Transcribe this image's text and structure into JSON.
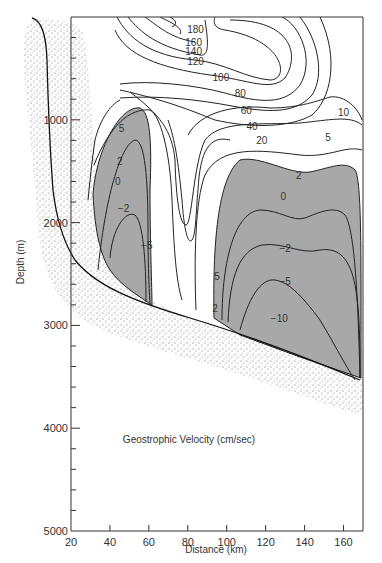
{
  "chart_data": {
    "type": "contour",
    "title": "Geostrophic Velocity (cm/sec)",
    "xlabel": "Distance (km)",
    "ylabel": "Depth (m)",
    "xlim": [
      20,
      170
    ],
    "ylim": [
      0,
      5000
    ],
    "y_inverted": true,
    "x_ticks": [
      20,
      40,
      60,
      80,
      100,
      120,
      140,
      160
    ],
    "y_ticks_labeled": [
      1000,
      2000,
      3000,
      4000,
      5000
    ],
    "y_minor_step": 200,
    "contour_levels": [
      180,
      160,
      140,
      120,
      100,
      80,
      60,
      40,
      20,
      10,
      5,
      2,
      0,
      -2,
      -5,
      -10
    ],
    "contour_labels": [
      {
        "text": "180",
        "x": 84,
        "depth": 120
      },
      {
        "text": "160",
        "x": 83,
        "depth": 240
      },
      {
        "text": "140",
        "x": 83,
        "depth": 330
      },
      {
        "text": "120",
        "x": 84,
        "depth": 430
      },
      {
        "text": "100",
        "x": 97,
        "depth": 580
      },
      {
        "text": "80",
        "x": 107,
        "depth": 740
      },
      {
        "text": "60",
        "x": 110,
        "depth": 900
      },
      {
        "text": "40",
        "x": 113,
        "depth": 1060
      },
      {
        "text": "20",
        "x": 118,
        "depth": 1200
      },
      {
        "text": "10",
        "x": 160,
        "depth": 920
      },
      {
        "text": "5",
        "x": 152,
        "depth": 1170
      },
      {
        "text": "2",
        "x": 137,
        "depth": 1540
      },
      {
        "text": "0",
        "x": 129,
        "depth": 1740
      },
      {
        "text": "5",
        "x": 46,
        "depth": 1080
      },
      {
        "text": "2",
        "x": 45,
        "depth": 1400
      },
      {
        "text": "0",
        "x": 44,
        "depth": 1600
      },
      {
        "text": "-2",
        "x": 47,
        "depth": 1860
      },
      {
        "text": "-5",
        "x": 59,
        "depth": 2220
      },
      {
        "text": "5",
        "x": 95,
        "depth": 2520
      },
      {
        "text": "2",
        "x": 94,
        "depth": 2830
      },
      {
        "text": "-2",
        "x": 130,
        "depth": 2250
      },
      {
        "text": "-5",
        "x": 130,
        "depth": 2570
      },
      {
        "text": "-10",
        "x": 127,
        "depth": 2930
      }
    ],
    "shaded_region_meaning": "velocity < 0 (gray)",
    "bottom_topography": [
      {
        "x": 33,
        "depth": 30
      },
      {
        "x": 42,
        "depth": 500
      },
      {
        "x": 45,
        "depth": 1200
      },
      {
        "x": 47,
        "depth": 1850
      },
      {
        "x": 50,
        "depth": 2300
      },
      {
        "x": 60,
        "depth": 2650
      },
      {
        "x": 75,
        "depth": 2900
      },
      {
        "x": 100,
        "depth": 3200
      },
      {
        "x": 130,
        "depth": 3500
      },
      {
        "x": 168,
        "depth": 3880
      }
    ],
    "grid": false,
    "legend": "none"
  }
}
